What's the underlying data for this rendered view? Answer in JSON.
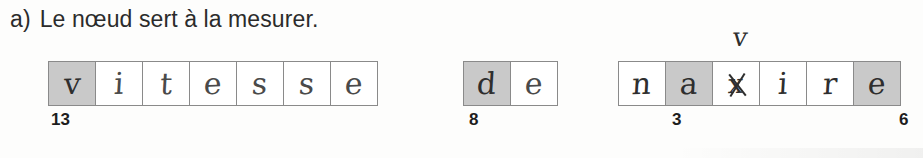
{
  "document": {
    "type": "scanned-worksheet",
    "language": "fr"
  },
  "prompt": {
    "marker": "a)",
    "sentence": "Le nœud sert à la mesurer."
  },
  "answers": [
    {
      "word": "vitesse",
      "cells": [
        {
          "letter": "v",
          "shaded": true,
          "struck": false
        },
        {
          "letter": "i",
          "shaded": false,
          "struck": false
        },
        {
          "letter": "t",
          "shaded": false,
          "struck": false
        },
        {
          "letter": "e",
          "shaded": false,
          "struck": false
        },
        {
          "letter": "s",
          "shaded": false,
          "struck": false
        },
        {
          "letter": "s",
          "shaded": false,
          "struck": false
        },
        {
          "letter": "e",
          "shaded": false,
          "struck": false
        }
      ],
      "scores": [
        {
          "value": "13",
          "cell_index": 0
        }
      ],
      "corrections": []
    },
    {
      "word": "de",
      "cells": [
        {
          "letter": "d",
          "shaded": true,
          "struck": false
        },
        {
          "letter": "e",
          "shaded": false,
          "struck": false
        }
      ],
      "scores": [
        {
          "value": "8",
          "cell_index": 0
        }
      ],
      "corrections": []
    },
    {
      "word": "navire",
      "cells": [
        {
          "letter": "n",
          "shaded": false,
          "struck": false
        },
        {
          "letter": "a",
          "shaded": true,
          "struck": false
        },
        {
          "letter": "x",
          "shaded": false,
          "struck": true
        },
        {
          "letter": "i",
          "shaded": false,
          "struck": false
        },
        {
          "letter": "r",
          "shaded": false,
          "struck": false
        },
        {
          "letter": "e",
          "shaded": true,
          "struck": false
        }
      ],
      "scores": [
        {
          "value": "3",
          "cell_index": 1
        },
        {
          "value": "6",
          "cell_index": 5
        }
      ],
      "corrections": [
        {
          "letter": "v",
          "cell_index": 2
        }
      ]
    }
  ],
  "colors": {
    "page_background": "#fdfdfc",
    "cell_border": "#8a8a8a",
    "cell_shaded": "#c9c9c9",
    "handwriting_ink": "#4a4a4a",
    "print_text": "#2b2b2b",
    "score_text": "#1d1d1d"
  }
}
